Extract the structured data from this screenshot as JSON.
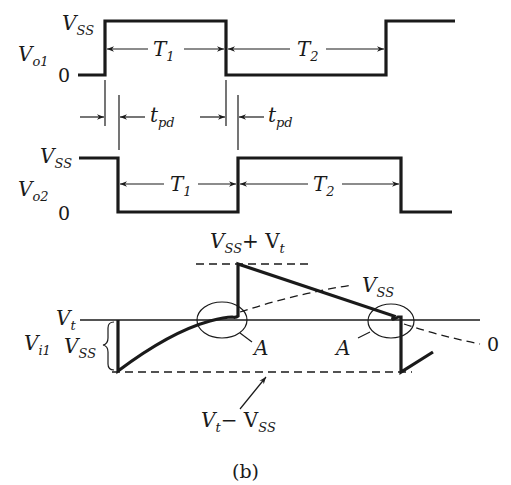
{
  "figure": {
    "caption": "(b)",
    "colors": {
      "ink": "#1a1a1a",
      "background": "#ffffff"
    }
  },
  "vo1": {
    "signal_label": "V",
    "signal_sub": "o1",
    "high_label": "V",
    "high_sub": "SS",
    "low_label": "0",
    "period1_label": "T",
    "period1_sub": "1",
    "period2_label": "T",
    "period2_sub": "2"
  },
  "delays": {
    "tpd1_label": "t",
    "tpd1_sub": "pd",
    "tpd2_label": "t",
    "tpd2_sub": "pd"
  },
  "vo2": {
    "signal_label": "V",
    "signal_sub": "o2",
    "high_label": "V",
    "high_sub": "SS",
    "low_label": "0",
    "period1_label": "T",
    "period1_sub": "1",
    "period2_label": "T",
    "period2_sub": "2"
  },
  "vi1": {
    "signal_label": "V",
    "signal_sub": "i1",
    "threshold_label": "V",
    "threshold_sub": "t",
    "swing_label": "V",
    "swing_sub": "SS",
    "peak_label_a": "V",
    "peak_label_a_sub": "SS",
    "peak_label_plus": "+ V",
    "peak_label_plus_sub": "t",
    "asymptote_label": "V",
    "asymptote_sub": "SS",
    "zero_label": "0",
    "point_a_left": "A",
    "point_a_right": "A",
    "min_label_a": "V",
    "min_label_a_sub": "t",
    "min_label_minus": "− V",
    "min_label_minus_sub": "SS"
  }
}
